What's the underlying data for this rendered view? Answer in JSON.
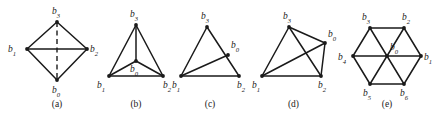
{
  "figure": {
    "background_color": "#ffffff",
    "line_color": "#1a1a1a",
    "panels": [
      {
        "id": "a",
        "caption": "(a)",
        "shape_description": "diamond with horizontal solid diagonal and vertical dashed diagonal",
        "vertices": [
          {
            "name": "b3",
            "base": "b",
            "sub": "3",
            "x": 57,
            "y": 22,
            "label_x": 52,
            "label_y": 14
          },
          {
            "name": "b1",
            "base": "b",
            "sub": "1",
            "x": 27,
            "y": 49,
            "label_x": 8,
            "label_y": 52
          },
          {
            "name": "b2",
            "base": "b",
            "sub": "2",
            "x": 87,
            "y": 49,
            "label_x": 90,
            "label_y": 52
          },
          {
            "name": "b0",
            "base": "b",
            "sub": "0",
            "x": 57,
            "y": 80,
            "label_x": 52,
            "label_y": 93
          }
        ],
        "solid_edges": [
          [
            "b3",
            "b1"
          ],
          [
            "b3",
            "b2"
          ],
          [
            "b1",
            "b0"
          ],
          [
            "b2",
            "b0"
          ],
          [
            "b1",
            "b2"
          ]
        ],
        "dashed_edges": [
          [
            "b3",
            "b0"
          ]
        ]
      },
      {
        "id": "b",
        "caption": "(b)",
        "shape_description": "triangle with interior point joined to all three corners",
        "vertices": [
          {
            "name": "b3",
            "base": "b",
            "sub": "3",
            "x": 136,
            "y": 25,
            "label_x": 130,
            "label_y": 17
          },
          {
            "name": "b1",
            "base": "b",
            "sub": "1",
            "x": 109,
            "y": 76,
            "label_x": 97,
            "label_y": 88
          },
          {
            "name": "b2",
            "base": "b",
            "sub": "2",
            "x": 163,
            "y": 76,
            "label_x": 163,
            "label_y": 88
          },
          {
            "name": "b0",
            "base": "b",
            "sub": "0",
            "x": 136,
            "y": 61,
            "label_x": 130,
            "label_y": 72
          }
        ],
        "solid_edges": [
          [
            "b3",
            "b1"
          ],
          [
            "b3",
            "b2"
          ],
          [
            "b1",
            "b2"
          ],
          [
            "b0",
            "b3"
          ],
          [
            "b0",
            "b1"
          ],
          [
            "b0",
            "b2"
          ]
        ],
        "dashed_edges": []
      },
      {
        "id": "c",
        "caption": "(c)",
        "shape_description": "triangle with a point on one edge joined to the opposite corner",
        "vertices": [
          {
            "name": "b3",
            "base": "b",
            "sub": "3",
            "x": 207,
            "y": 27,
            "label_x": 201,
            "label_y": 19
          },
          {
            "name": "b1",
            "base": "b",
            "sub": "1",
            "x": 181,
            "y": 76,
            "label_x": 172,
            "label_y": 88
          },
          {
            "name": "b2",
            "base": "b",
            "sub": "2",
            "x": 239,
            "y": 76,
            "label_x": 237,
            "label_y": 88
          },
          {
            "name": "b0",
            "base": "b",
            "sub": "0",
            "x": 228,
            "y": 55,
            "label_x": 231,
            "label_y": 48
          }
        ],
        "solid_edges": [
          [
            "b3",
            "b1"
          ],
          [
            "b3",
            "b2"
          ],
          [
            "b1",
            "b2"
          ],
          [
            "b1",
            "b0"
          ]
        ],
        "dashed_edges": []
      },
      {
        "id": "d",
        "caption": "(d)",
        "shape_description": "quadrilateral with both diagonals drawn",
        "vertices": [
          {
            "name": "b3",
            "base": "b",
            "sub": "3",
            "x": 289,
            "y": 27,
            "label_x": 283,
            "label_y": 19
          },
          {
            "name": "b0",
            "base": "b",
            "sub": "0",
            "x": 325,
            "y": 43,
            "label_x": 328,
            "label_y": 37
          },
          {
            "name": "b1",
            "base": "b",
            "sub": "1",
            "x": 262,
            "y": 76,
            "label_x": 252,
            "label_y": 88
          },
          {
            "name": "b2",
            "base": "b",
            "sub": "2",
            "x": 321,
            "y": 76,
            "label_x": 318,
            "label_y": 88
          }
        ],
        "solid_edges": [
          [
            "b3",
            "b0"
          ],
          [
            "b0",
            "b2"
          ],
          [
            "b2",
            "b1"
          ],
          [
            "b1",
            "b3"
          ],
          [
            "b1",
            "b0"
          ],
          [
            "b3",
            "b2"
          ]
        ],
        "dashed_edges": []
      },
      {
        "id": "e",
        "caption": "(e)",
        "shape_description": "regular hexagon with centre point joined to all six corners",
        "vertices": [
          {
            "name": "b3",
            "base": "b",
            "sub": "3",
            "x": 370,
            "y": 28,
            "label_x": 362,
            "label_y": 20
          },
          {
            "name": "b2",
            "base": "b",
            "sub": "2",
            "x": 404,
            "y": 28,
            "label_x": 402,
            "label_y": 20
          },
          {
            "name": "b1",
            "base": "b",
            "sub": "1",
            "x": 421,
            "y": 56,
            "label_x": 424,
            "label_y": 60
          },
          {
            "name": "b6",
            "base": "b",
            "sub": "6",
            "x": 404,
            "y": 84,
            "label_x": 400,
            "label_y": 96
          },
          {
            "name": "b5",
            "base": "b",
            "sub": "5",
            "x": 370,
            "y": 84,
            "label_x": 363,
            "label_y": 96
          },
          {
            "name": "b4",
            "base": "b",
            "sub": "4",
            "x": 353,
            "y": 56,
            "label_x": 338,
            "label_y": 60
          },
          {
            "name": "b0",
            "base": "b",
            "sub": "0",
            "x": 387,
            "y": 56,
            "label_x": 390,
            "label_y": 50
          }
        ],
        "solid_edges": [
          [
            "b3",
            "b2"
          ],
          [
            "b2",
            "b1"
          ],
          [
            "b1",
            "b6"
          ],
          [
            "b6",
            "b5"
          ],
          [
            "b5",
            "b4"
          ],
          [
            "b4",
            "b3"
          ],
          [
            "b4",
            "b1"
          ],
          [
            "b3",
            "b6"
          ],
          [
            "b2",
            "b5"
          ]
        ],
        "dashed_edges": []
      }
    ]
  }
}
